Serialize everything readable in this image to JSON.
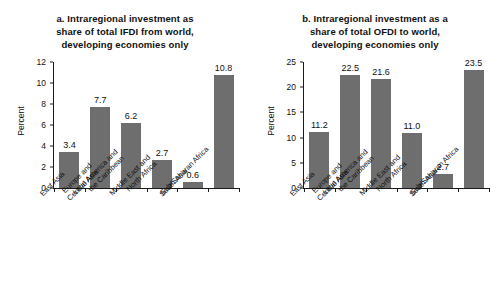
{
  "figure": {
    "background": "#ffffff",
    "bar_color": "#6e6e6e",
    "axis_color": "#1a1a1a"
  },
  "panels": [
    {
      "id": "panel-a",
      "title_line1": "a. Intraregional investment as",
      "title_line2": "share of total IFDI from world,",
      "title_line3": "developing economies only",
      "ylabel": "Percent",
      "yticks": [
        "0",
        "2",
        "4",
        "6",
        "8",
        "10",
        "12"
      ]
    },
    {
      "id": "panel-b",
      "title_line1": "b. Intraregional investment as a",
      "title_line2": "share of total OFDI to world,",
      "title_line3": "developing economies only",
      "ylabel": "Percent",
      "yticks": [
        "0",
        "5",
        "10",
        "15",
        "20",
        "25"
      ]
    }
  ],
  "chart_data": [
    {
      "type": "bar",
      "id": "panel-a",
      "title": "a. Intraregional investment as share of total IFDI from world, developing economies only",
      "xlabel": "",
      "ylabel": "Percent",
      "ylim": [
        0,
        12
      ],
      "ytick_values": [
        0,
        2,
        4,
        6,
        8,
        10,
        12
      ],
      "grid": false,
      "legend": "none",
      "bar_color": "#6e6e6e",
      "categories": [
        "East Asia",
        "Europe and Central Asia",
        "Latin America and the Caribbean",
        "Middle East and North Africa",
        "South Asia",
        "Sub-Saharan Africa"
      ],
      "category_lines": [
        [
          "East Asia"
        ],
        [
          "Europe and",
          "Central Asia"
        ],
        [
          "Latin America and",
          "the Caribbean"
        ],
        [
          "Middle East and",
          "North Africa"
        ],
        [
          "South Asia"
        ],
        [
          "Sub-Saharan Africa"
        ]
      ],
      "values": [
        3.4,
        7.7,
        6.2,
        2.7,
        0.6,
        10.8
      ],
      "data_labels": [
        "3.4",
        "7.7",
        "6.2",
        "2.7",
        "0.6",
        "10.8"
      ]
    },
    {
      "type": "bar",
      "id": "panel-b",
      "title": "b. Intraregional investment as a share of total OFDI to world, developing economies only",
      "xlabel": "",
      "ylabel": "Percent",
      "ylim": [
        0,
        25
      ],
      "ytick_values": [
        0,
        5,
        10,
        15,
        20,
        25
      ],
      "grid": false,
      "legend": "none",
      "bar_color": "#6e6e6e",
      "categories": [
        "East Asia",
        "Europe and Central Asia",
        "Latin America and the Caribbean",
        "Middle East and North Africa",
        "South Asia",
        "Sub-Saharan Africa"
      ],
      "category_lines": [
        [
          "East Asia"
        ],
        [
          "Europe and",
          "Central Asia"
        ],
        [
          "Latin America and",
          "the Caribbean"
        ],
        [
          "Middle East and",
          "North Africa"
        ],
        [
          "South Asia"
        ],
        [
          "Sub-Saharan Africa"
        ]
      ],
      "values": [
        11.2,
        22.5,
        21.6,
        11.0,
        2.7,
        23.5
      ],
      "data_labels": [
        "11.2",
        "22.5",
        "21.6",
        "11.0",
        "2.7",
        "23.5"
      ]
    }
  ]
}
